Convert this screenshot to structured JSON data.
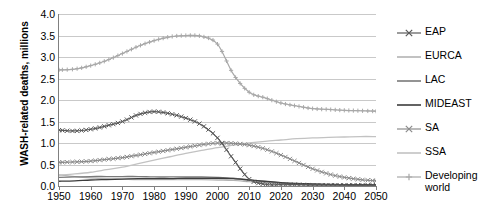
{
  "chart_data": {
    "type": "line",
    "title": "",
    "xlabel": "",
    "ylabel": "WASH-related deaths, millions",
    "xlim": [
      1950,
      2050
    ],
    "ylim": [
      0.0,
      4.0
    ],
    "ytick_step": 0.5,
    "xtick_step": 10,
    "grid": "horizontal",
    "legend_position": "right",
    "ytick_labels": [
      "0.0",
      "0.5",
      "1.0",
      "1.5",
      "2.0",
      "2.5",
      "3.0",
      "3.5",
      "4.0"
    ],
    "xtick_labels": [
      "1950",
      "1960",
      "1970",
      "1980",
      "1990",
      "2000",
      "2010",
      "2020",
      "2030",
      "2040",
      "2050"
    ],
    "x": [
      1950,
      1955,
      1960,
      1965,
      1970,
      1975,
      1980,
      1985,
      1990,
      1995,
      2000,
      2005,
      2010,
      2015,
      2020,
      2025,
      2030,
      2035,
      2040,
      2045,
      2050
    ],
    "series": [
      {
        "name": "EAP",
        "color": "#595959",
        "marker": "x",
        "values": [
          1.3,
          1.28,
          1.32,
          1.4,
          1.5,
          1.66,
          1.73,
          1.68,
          1.58,
          1.42,
          1.12,
          0.62,
          0.16,
          0.04,
          0.03,
          0.03,
          0.02,
          0.02,
          0.02,
          0.02,
          0.02
        ]
      },
      {
        "name": "EURCA",
        "color": "#b3b3b3",
        "marker": "none",
        "values": [
          0.26,
          0.22,
          0.19,
          0.17,
          0.16,
          0.15,
          0.15,
          0.15,
          0.15,
          0.15,
          0.14,
          0.13,
          0.1,
          0.07,
          0.05,
          0.04,
          0.03,
          0.03,
          0.02,
          0.02,
          0.02
        ]
      },
      {
        "name": "LAC",
        "color": "#7a7a7a",
        "marker": "none",
        "values": [
          0.2,
          0.21,
          0.22,
          0.22,
          0.22,
          0.22,
          0.21,
          0.21,
          0.21,
          0.21,
          0.2,
          0.18,
          0.14,
          0.1,
          0.07,
          0.05,
          0.04,
          0.03,
          0.03,
          0.02,
          0.02
        ]
      },
      {
        "name": "MIDEAST",
        "color": "#3d3d3d",
        "marker": "none",
        "values": [
          0.11,
          0.12,
          0.14,
          0.15,
          0.16,
          0.17,
          0.17,
          0.17,
          0.18,
          0.18,
          0.18,
          0.17,
          0.14,
          0.11,
          0.08,
          0.06,
          0.05,
          0.04,
          0.03,
          0.03,
          0.03
        ]
      },
      {
        "name": "SA",
        "color": "#8c8c8c",
        "marker": "x",
        "values": [
          0.55,
          0.56,
          0.58,
          0.62,
          0.66,
          0.72,
          0.78,
          0.84,
          0.9,
          0.96,
          1.0,
          0.99,
          0.95,
          0.86,
          0.72,
          0.56,
          0.4,
          0.28,
          0.2,
          0.15,
          0.12
        ]
      },
      {
        "name": "SSA",
        "color": "#c2c2c2",
        "marker": "none",
        "values": [
          0.25,
          0.28,
          0.32,
          0.38,
          0.44,
          0.52,
          0.6,
          0.68,
          0.76,
          0.83,
          0.89,
          0.95,
          1.0,
          1.04,
          1.07,
          1.1,
          1.12,
          1.13,
          1.14,
          1.15,
          1.15
        ]
      },
      {
        "name": "Developing world",
        "color": "#a8a8a8",
        "marker": "plus",
        "values": [
          2.7,
          2.72,
          2.8,
          2.92,
          3.08,
          3.25,
          3.38,
          3.47,
          3.5,
          3.48,
          3.3,
          2.6,
          2.18,
          2.05,
          1.93,
          1.86,
          1.8,
          1.78,
          1.76,
          1.75,
          1.74
        ]
      }
    ]
  },
  "legend": {
    "items": [
      {
        "label": "EAP"
      },
      {
        "label": "EURCA"
      },
      {
        "label": "LAC"
      },
      {
        "label": "MIDEAST"
      },
      {
        "label": "SA"
      },
      {
        "label": "SSA"
      },
      {
        "label": "Developing world"
      }
    ]
  }
}
